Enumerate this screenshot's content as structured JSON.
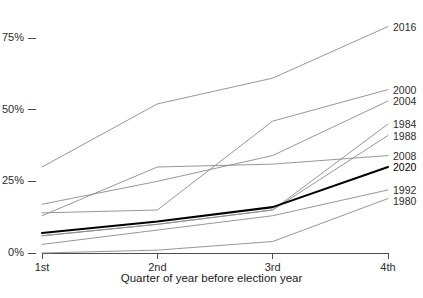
{
  "chart_data": {
    "type": "line",
    "title": "",
    "subtitle": "",
    "xlabel": "Quarter of year before election year",
    "ylabel": "",
    "categories": [
      "1st",
      "2nd",
      "3rd",
      "4th"
    ],
    "x_tick_labels": [
      "1st",
      "2nd",
      "3rd",
      "4th"
    ],
    "y_tick_labels": [
      "0%",
      "25%",
      "50%",
      "75%"
    ],
    "y_tick_values": [
      0,
      25,
      50,
      75
    ],
    "ylim": [
      0,
      82
    ],
    "xlim": [
      1,
      4
    ],
    "grid": false,
    "legend_position": "right-inline-line-end-labels",
    "units": "percent",
    "series": [
      {
        "name": "2016",
        "label": "2016",
        "color": "#8a8a8a",
        "emphasis": false,
        "x": [
          "1st",
          "2nd",
          "3rd",
          "4th"
        ],
        "values": [
          30,
          52,
          61,
          79
        ]
      },
      {
        "name": "2000",
        "label": "2000",
        "color": "#8a8a8a",
        "emphasis": false,
        "x": [
          "1st",
          "2nd",
          "3rd",
          "4th"
        ],
        "values": [
          14,
          15,
          46,
          57
        ]
      },
      {
        "name": "2004",
        "label": "2004",
        "color": "#8a8a8a",
        "emphasis": false,
        "x": [
          "1st",
          "2nd",
          "3rd",
          "4th"
        ],
        "values": [
          17,
          25,
          34,
          53
        ]
      },
      {
        "name": "1984",
        "label": "1984",
        "color": "#8a8a8a",
        "emphasis": false,
        "x": [
          "1st",
          "2nd",
          "3rd",
          "4th"
        ],
        "values": [
          6,
          10,
          15,
          45
        ]
      },
      {
        "name": "1988",
        "label": "1988",
        "color": "#8a8a8a",
        "emphasis": false,
        "x": [
          "1st",
          "2nd",
          "3rd",
          "4th"
        ],
        "values": [
          6,
          10,
          15,
          41
        ]
      },
      {
        "name": "2008",
        "label": "2008",
        "color": "#8a8a8a",
        "emphasis": false,
        "x": [
          "1st",
          "2nd",
          "3rd",
          "4th"
        ],
        "values": [
          13,
          30,
          31,
          34
        ]
      },
      {
        "name": "2020",
        "label": "2020",
        "color": "#000000",
        "emphasis": true,
        "x": [
          "1st",
          "2nd",
          "3rd",
          "4th"
        ],
        "values": [
          7,
          11,
          16,
          30
        ]
      },
      {
        "name": "1992",
        "label": "1992",
        "color": "#8a8a8a",
        "emphasis": false,
        "x": [
          "1st",
          "2nd",
          "3rd",
          "4th"
        ],
        "values": [
          3,
          8,
          13,
          22
        ]
      },
      {
        "name": "1980",
        "label": "1980",
        "color": "#8a8a8a",
        "emphasis": false,
        "x": [
          "1st",
          "2nd",
          "3rd",
          "4th"
        ],
        "values": [
          0,
          1,
          4,
          19
        ]
      }
    ],
    "axis_color": "#4d4d4d",
    "line_color_default": "#8a8a8a",
    "emphasis_color": "#000000"
  },
  "axes": {
    "x_title": "Quarter of year before election year"
  }
}
